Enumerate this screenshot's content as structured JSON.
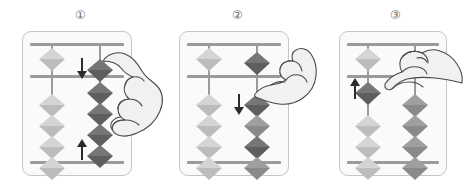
{
  "figure": {
    "panel_count": 3,
    "bead_colors": {
      "light": "#d4d4d4",
      "mid": "#9f9f9f",
      "dark": "#767676",
      "frame": "#9a9a9a",
      "card_bg": "#fafafa",
      "card_border": "#c5c5c5",
      "arrow": "#2b2b2b",
      "hand_fill": "#f2f1ef",
      "hand_stroke": "#4a4a4a"
    }
  },
  "panels": [
    {
      "id": "panel-1",
      "step_label": "①",
      "step_number": 1,
      "arrows": [
        {
          "name": "arrow-down-upper",
          "direction": "down"
        },
        {
          "name": "arrow-up-lower",
          "direction": "up"
        }
      ],
      "hand": {
        "name": "hand-pinch-right",
        "description": "right hand pinching heaven bead and earth beads"
      },
      "rods": [
        {
          "name": "rod-left",
          "heaven_beads": [
            {
              "tone": "light",
              "position": "up"
            }
          ],
          "earth_beads": [
            {
              "tone": "light",
              "position": "down"
            },
            {
              "tone": "light",
              "position": "down"
            },
            {
              "tone": "light",
              "position": "down"
            },
            {
              "tone": "light",
              "position": "down"
            }
          ]
        },
        {
          "name": "rod-right",
          "heaven_beads": [
            {
              "tone": "dark",
              "position": "down-at-beam"
            }
          ],
          "earth_beads": [
            {
              "tone": "dark",
              "position": "up-at-beam"
            },
            {
              "tone": "dark",
              "position": "up-at-beam"
            },
            {
              "tone": "dark",
              "position": "up-at-beam"
            },
            {
              "tone": "dark",
              "position": "up-at-beam"
            }
          ]
        }
      ]
    },
    {
      "id": "panel-2",
      "step_label": "②",
      "step_number": 2,
      "arrows": [
        {
          "name": "arrow-down-middle",
          "direction": "down"
        }
      ],
      "hand": {
        "name": "hand-index-press-right",
        "description": "right hand with index finger pressing top earth bead downward"
      },
      "rods": [
        {
          "name": "rod-left",
          "heaven_beads": [
            {
              "tone": "light",
              "position": "up"
            }
          ],
          "earth_beads": [
            {
              "tone": "light",
              "position": "down"
            },
            {
              "tone": "light",
              "position": "down"
            },
            {
              "tone": "light",
              "position": "down"
            },
            {
              "tone": "light",
              "position": "down"
            }
          ]
        },
        {
          "name": "rod-right",
          "heaven_beads": [
            {
              "tone": "dark",
              "position": "down-at-beam"
            }
          ],
          "earth_beads": [
            {
              "tone": "dark",
              "position": "down"
            },
            {
              "tone": "mid",
              "position": "down"
            },
            {
              "tone": "dark",
              "position": "down"
            },
            {
              "tone": "mid",
              "position": "down"
            }
          ]
        }
      ]
    },
    {
      "id": "panel-3",
      "step_label": "③",
      "step_number": 3,
      "arrows": [
        {
          "name": "arrow-up-left",
          "direction": "up"
        }
      ],
      "hand": {
        "name": "hand-thumb-push-right",
        "description": "right hand with thumb pushing earth bead upward on left rod"
      },
      "rods": [
        {
          "name": "rod-left",
          "heaven_beads": [
            {
              "tone": "light",
              "position": "up"
            }
          ],
          "earth_beads": [
            {
              "tone": "dark",
              "position": "up-at-beam"
            },
            {
              "tone": "light",
              "position": "down"
            },
            {
              "tone": "light",
              "position": "down"
            },
            {
              "tone": "light",
              "position": "down"
            }
          ]
        },
        {
          "name": "rod-right",
          "heaven_beads": [],
          "earth_beads": [
            {
              "tone": "mid",
              "position": "down"
            },
            {
              "tone": "mid",
              "position": "down"
            },
            {
              "tone": "mid",
              "position": "down"
            },
            {
              "tone": "mid",
              "position": "down"
            }
          ]
        }
      ]
    }
  ]
}
